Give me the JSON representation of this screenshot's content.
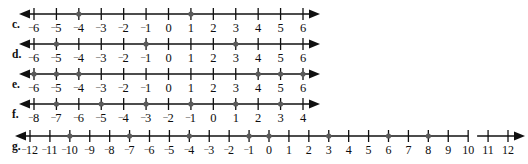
{
  "figure": {
    "kind": "number-line-exercise",
    "background_color": "#ffffff",
    "ink_color": "#101010",
    "dot_color": "#5a5a5a",
    "negative_sign": "⁻",
    "rows": [
      {
        "id": "c",
        "label": "c.",
        "min": -6,
        "max": 6,
        "step": 1,
        "dots": [
          -4,
          1
        ],
        "tick_labels": [
          "⁻6",
          "⁻5",
          "⁻4",
          "⁻3",
          "⁻2",
          "⁻1",
          "0",
          "1",
          "2",
          "3",
          "4",
          "5",
          "6"
        ],
        "left_arrow": true,
        "right_arrow": true,
        "breaks": []
      },
      {
        "id": "d",
        "label": "d.",
        "min": -6,
        "max": 6,
        "step": 1,
        "dots": [
          -5,
          -1,
          3
        ],
        "tick_labels": [
          "⁻6",
          "⁻5",
          "⁻4",
          "⁻3",
          "⁻2",
          "⁻1",
          "0",
          "1",
          "2",
          "3",
          "4",
          "5",
          "6"
        ],
        "left_arrow": true,
        "right_arrow": true,
        "breaks": []
      },
      {
        "id": "e",
        "label": "e.",
        "min": -6,
        "max": 6,
        "step": 1,
        "dots": [
          -6,
          -5,
          -4,
          4,
          5,
          6
        ],
        "tick_labels": [
          "⁻6",
          "⁻5",
          "⁻4",
          "⁻3",
          "⁻2",
          "⁻1",
          "0",
          "1",
          "2",
          "3",
          "4",
          "5",
          "6"
        ],
        "left_arrow": true,
        "right_arrow": true,
        "breaks": []
      },
      {
        "id": "f",
        "label": "f.",
        "min": -8,
        "max": 4,
        "step": 1,
        "dots": [
          -7,
          -5,
          -3,
          -1,
          1,
          3
        ],
        "tick_labels": [
          "⁻8",
          "⁻7",
          "⁻6",
          "⁻5",
          "⁻4",
          "⁻3",
          "⁻2",
          "⁻1",
          "0",
          "1",
          "2",
          "3",
          "4"
        ],
        "left_arrow": true,
        "right_arrow": true,
        "breaks": []
      },
      {
        "id": "g",
        "label": "g.",
        "min": -12,
        "max": 12,
        "step": 1,
        "dots": [
          -10,
          -7,
          -4,
          -1,
          0,
          3,
          6,
          8
        ],
        "tick_labels": [
          "⁻12",
          "⁻11",
          "⁻10",
          "⁻9",
          "⁻8",
          "⁻7",
          "⁻6",
          "⁻5",
          "⁻4",
          "⁻3",
          "⁻2",
          "⁻1",
          "0",
          "1",
          "2",
          "3",
          "4",
          "5",
          "6",
          "7",
          "8",
          "9",
          "10",
          "11",
          "12"
        ],
        "left_arrow": true,
        "right_arrow": true,
        "breaks": [
          [
            10,
            10.45
          ]
        ]
      }
    ]
  },
  "geometry": {
    "row_height": 33,
    "row_tops": [
      0,
      30,
      60,
      90,
      122
    ],
    "axis_y": 14,
    "tick_half": 6,
    "dot_radius": 2.6,
    "label_baseline_offset": 30,
    "plot_left": [
      34,
      34,
      34,
      34,
      30
    ],
    "plot_right": [
      303,
      303,
      303,
      303,
      508
    ],
    "line_extra_left": 8,
    "line_extra_right": 10
  }
}
